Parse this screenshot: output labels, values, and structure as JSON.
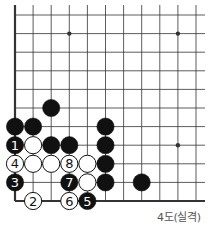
{
  "diagram": {
    "caption": "4도(실격)",
    "grid": {
      "origin_x": 15,
      "origin_y": 15,
      "dx": 18.1,
      "dy": 18.6,
      "cols": 11,
      "rows": 11,
      "edges": [
        "left",
        "bottom"
      ],
      "line_extend_right": 205,
      "line_extend_top": 5
    },
    "star_points": [
      [
        3,
        1
      ],
      [
        9,
        1
      ],
      [
        9,
        7
      ]
    ],
    "stones": [
      {
        "col": 2,
        "row": 5,
        "color": "black",
        "label": ""
      },
      {
        "col": 0,
        "row": 6,
        "color": "black",
        "label": ""
      },
      {
        "col": 1,
        "row": 6,
        "color": "black",
        "label": ""
      },
      {
        "col": 5,
        "row": 6,
        "color": "black",
        "label": ""
      },
      {
        "col": 0,
        "row": 7,
        "color": "black",
        "label": "1"
      },
      {
        "col": 1,
        "row": 7,
        "color": "white",
        "label": ""
      },
      {
        "col": 2,
        "row": 7,
        "color": "black",
        "label": ""
      },
      {
        "col": 3,
        "row": 7,
        "color": "black",
        "label": ""
      },
      {
        "col": 5,
        "row": 7,
        "color": "black",
        "label": ""
      },
      {
        "col": 0,
        "row": 8,
        "color": "white",
        "label": "4"
      },
      {
        "col": 1,
        "row": 8,
        "color": "white",
        "label": ""
      },
      {
        "col": 2,
        "row": 8,
        "color": "white",
        "label": ""
      },
      {
        "col": 3,
        "row": 8,
        "color": "white",
        "label": "8"
      },
      {
        "col": 4,
        "row": 8,
        "color": "white",
        "label": ""
      },
      {
        "col": 5,
        "row": 8,
        "color": "black",
        "label": ""
      },
      {
        "col": 0,
        "row": 9,
        "color": "black",
        "label": "3"
      },
      {
        "col": 3,
        "row": 9,
        "color": "black",
        "label": "7"
      },
      {
        "col": 4,
        "row": 9,
        "color": "white",
        "label": ""
      },
      {
        "col": 5,
        "row": 9,
        "color": "black",
        "label": ""
      },
      {
        "col": 7,
        "row": 9,
        "color": "black",
        "label": ""
      },
      {
        "col": 1,
        "row": 10,
        "color": "white",
        "label": "2"
      },
      {
        "col": 3,
        "row": 10,
        "color": "white",
        "label": "6"
      },
      {
        "col": 4,
        "row": 10,
        "color": "black",
        "label": "5"
      }
    ],
    "colors": {
      "line": "#333333",
      "black_stone": "#111111",
      "white_stone": "#ffffff",
      "caption": "#555555"
    }
  }
}
